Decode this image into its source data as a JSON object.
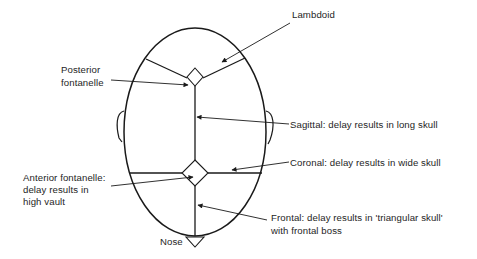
{
  "figure": {
    "colors": {
      "line": "#1a1a1a",
      "background": "#ffffff"
    }
  },
  "labels": {
    "lambdoid": "Lambdoid",
    "posterior_fontanelle_1": "Posterior",
    "posterior_fontanelle_2": "fontanelle",
    "sagittal": "Sagittal: delay results in long skull",
    "coronal": "Coronal: delay results in wide skull",
    "anterior_fontanelle_1": "Anterior fontanelle:",
    "anterior_fontanelle_2": "delay results in",
    "anterior_fontanelle_3": "high vault",
    "frontal_1": "Frontal: delay results in 'triangular skull'",
    "frontal_2": "with frontal boss",
    "nose": "Nose"
  }
}
